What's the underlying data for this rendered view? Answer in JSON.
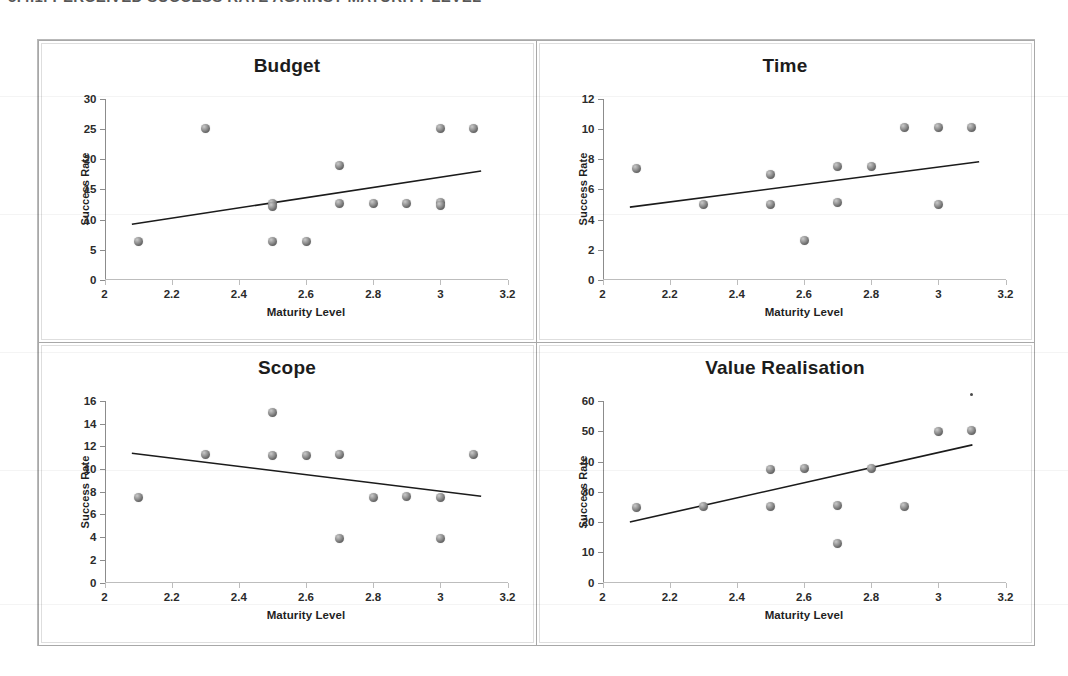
{
  "page": {
    "caption_sliver": "5.4.1.  PERCEIVED SUCCESS RATE AGAINST MATURITY LEVEL",
    "background_color": "#ffffff",
    "marker_color": "#6e6e6e",
    "trendline_color": "#1b1b1b",
    "axis_color": "#8c8c8c"
  },
  "shared": {
    "xlabel": "Maturity Level",
    "ylabel": "Success Rate",
    "xlim": [
      2,
      3.2
    ],
    "xticks": [
      "2",
      "2.2",
      "2.4",
      "2.6",
      "2.8",
      "3",
      "3.2"
    ],
    "xtick_values": [
      2,
      2.2,
      2.4,
      2.6,
      2.8,
      3,
      3.2
    ]
  },
  "chart_data": [
    {
      "type": "scatter",
      "title": "Budget",
      "xlabel": "Maturity Level",
      "ylabel": "Success Rate",
      "xlim": [
        2,
        3.2
      ],
      "ylim": [
        0,
        30
      ],
      "yticks": [
        "0",
        "5",
        "10",
        "15",
        "20",
        "25",
        "30"
      ],
      "ytick_values": [
        0,
        5,
        10,
        15,
        20,
        25,
        30
      ],
      "grid": false,
      "legend": "none",
      "points": [
        {
          "x": 2.1,
          "y": 6.3
        },
        {
          "x": 2.3,
          "y": 25.0
        },
        {
          "x": 2.5,
          "y": 12.6
        },
        {
          "x": 2.5,
          "y": 12.2
        },
        {
          "x": 2.5,
          "y": 6.3
        },
        {
          "x": 2.6,
          "y": 6.3
        },
        {
          "x": 2.7,
          "y": 19.0
        },
        {
          "x": 2.7,
          "y": 12.7
        },
        {
          "x": 2.8,
          "y": 12.7
        },
        {
          "x": 2.9,
          "y": 12.7
        },
        {
          "x": 3.0,
          "y": 25.1
        },
        {
          "x": 3.0,
          "y": 12.8
        },
        {
          "x": 3.0,
          "y": 12.3
        },
        {
          "x": 3.1,
          "y": 25.1
        }
      ],
      "trendline": {
        "x0": 2.08,
        "y0": 9.3,
        "x1": 3.12,
        "y1": 18.1
      }
    },
    {
      "type": "scatter",
      "title": "Time",
      "xlabel": "Maturity Level",
      "ylabel": "Success Rate",
      "xlim": [
        2,
        3.2
      ],
      "ylim": [
        0,
        12
      ],
      "yticks": [
        "0",
        "2",
        "4",
        "6",
        "8",
        "10",
        "12"
      ],
      "ytick_values": [
        0,
        2,
        4,
        6,
        8,
        10,
        12
      ],
      "grid": false,
      "legend": "none",
      "points": [
        {
          "x": 2.1,
          "y": 7.4
        },
        {
          "x": 2.3,
          "y": 5.0
        },
        {
          "x": 2.5,
          "y": 7.0
        },
        {
          "x": 2.5,
          "y": 5.0
        },
        {
          "x": 2.6,
          "y": 2.6
        },
        {
          "x": 2.7,
          "y": 7.5
        },
        {
          "x": 2.7,
          "y": 5.1
        },
        {
          "x": 2.8,
          "y": 7.5
        },
        {
          "x": 2.9,
          "y": 10.1
        },
        {
          "x": 3.0,
          "y": 10.1
        },
        {
          "x": 3.0,
          "y": 5.0
        },
        {
          "x": 3.1,
          "y": 10.1
        }
      ],
      "trendline": {
        "x0": 2.08,
        "y0": 4.85,
        "x1": 3.12,
        "y1": 7.85
      }
    },
    {
      "type": "scatter",
      "title": "Scope",
      "xlabel": "Maturity Level",
      "ylabel": "Success Rate",
      "xlim": [
        2,
        3.2
      ],
      "ylim": [
        0,
        16
      ],
      "yticks": [
        "0",
        "2",
        "4",
        "6",
        "8",
        "10",
        "12",
        "14",
        "16"
      ],
      "ytick_values": [
        0,
        2,
        4,
        6,
        8,
        10,
        12,
        14,
        16
      ],
      "grid": false,
      "legend": "none",
      "points": [
        {
          "x": 2.1,
          "y": 7.5
        },
        {
          "x": 2.3,
          "y": 11.3
        },
        {
          "x": 2.5,
          "y": 15.0
        },
        {
          "x": 2.5,
          "y": 11.2
        },
        {
          "x": 2.6,
          "y": 11.2
        },
        {
          "x": 2.7,
          "y": 11.3
        },
        {
          "x": 2.7,
          "y": 3.9
        },
        {
          "x": 2.8,
          "y": 7.5
        },
        {
          "x": 2.9,
          "y": 7.6
        },
        {
          "x": 3.0,
          "y": 7.5
        },
        {
          "x": 3.0,
          "y": 3.9
        },
        {
          "x": 3.1,
          "y": 11.3
        }
      ],
      "trendline": {
        "x0": 2.08,
        "y0": 11.4,
        "x1": 3.12,
        "y1": 7.6
      }
    },
    {
      "type": "scatter",
      "title": "Value Realisation",
      "xlabel": "Maturity Level",
      "ylabel": "Success Rate",
      "xlim": [
        2,
        3.2
      ],
      "ylim": [
        0,
        60
      ],
      "yticks": [
        "0",
        "10",
        "20",
        "30",
        "40",
        "50",
        "60"
      ],
      "ytick_values": [
        0,
        10,
        20,
        30,
        40,
        50,
        60
      ],
      "grid": false,
      "legend": "none",
      "points": [
        {
          "x": 2.1,
          "y": 24.8
        },
        {
          "x": 2.3,
          "y": 25.0
        },
        {
          "x": 2.5,
          "y": 37.5
        },
        {
          "x": 2.5,
          "y": 25.0
        },
        {
          "x": 2.6,
          "y": 37.7
        },
        {
          "x": 2.7,
          "y": 25.3
        },
        {
          "x": 2.7,
          "y": 13.0
        },
        {
          "x": 2.8,
          "y": 37.7
        },
        {
          "x": 2.9,
          "y": 25.2
        },
        {
          "x": 3.0,
          "y": 49.8
        },
        {
          "x": 3.1,
          "y": 50.2
        }
      ],
      "specks": [
        {
          "x": 3.1,
          "y": 62.0
        }
      ],
      "trendline": {
        "x0": 2.08,
        "y0": 20.0,
        "x1": 3.1,
        "y1": 45.5
      }
    }
  ]
}
